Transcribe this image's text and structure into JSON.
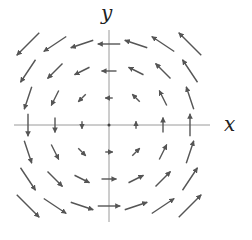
{
  "diagram": {
    "type": "vector_field",
    "field": "F(x,y) = (-y, x)",
    "x_label": "x",
    "y_label": "y",
    "grid": [
      -3,
      -2,
      -1,
      0,
      1,
      2,
      3
    ],
    "colors": {
      "axis": "#9a9a9a",
      "arrow": "#555555",
      "text": "#222222"
    }
  },
  "chart_data": {
    "type": "vector_field",
    "title": "",
    "xlabel": "x",
    "ylabel": "y",
    "x": [
      -3,
      -2,
      -1,
      0,
      1,
      2,
      3
    ],
    "y": [
      -3,
      -2,
      -1,
      0,
      1,
      2,
      3
    ],
    "u": "-y",
    "v": "x"
  }
}
